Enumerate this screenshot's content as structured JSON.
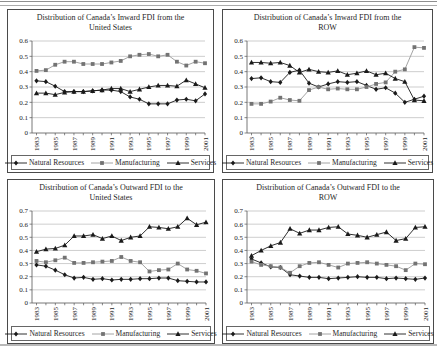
{
  "page": {
    "background": "#ffffff",
    "rule_color": "#9a9a9a"
  },
  "legend_labels": [
    "Natural Resources",
    "Manufacturing",
    "Services"
  ],
  "chart_data": [
    {
      "type": "line",
      "title_line1": "Distribution of Canada’s Inward FDI from the",
      "title_line2": "United States",
      "xlabel": "",
      "ylabel": "",
      "ylim": [
        0,
        0.6
      ],
      "ytick_step": 0.1,
      "grid": true,
      "legend_position": "bottom",
      "x": [
        1983,
        1984,
        1985,
        1986,
        1987,
        1988,
        1989,
        1990,
        1991,
        1992,
        1993,
        1994,
        1995,
        1996,
        1997,
        1998,
        1999,
        2000,
        2001
      ],
      "xtick_labels": [
        "1983",
        "1985",
        "1987",
        "1989",
        "1991",
        "1993",
        "1995",
        "1997",
        "1999",
        "2001"
      ],
      "series": [
        {
          "name": "Natural Resources",
          "marker": "diamond",
          "color": "#1a1a1a",
          "line_color": "#1a1a1a",
          "values": [
            0.34,
            0.335,
            0.305,
            0.27,
            0.27,
            0.27,
            0.275,
            0.28,
            0.28,
            0.27,
            0.235,
            0.22,
            0.19,
            0.19,
            0.19,
            0.215,
            0.22,
            0.21,
            0.255
          ]
        },
        {
          "name": "Manufacturing",
          "marker": "square",
          "color": "#737373",
          "line_color": "#9a9a9a",
          "values": [
            0.405,
            0.41,
            0.445,
            0.465,
            0.465,
            0.45,
            0.45,
            0.45,
            0.46,
            0.47,
            0.5,
            0.51,
            0.515,
            0.5,
            0.51,
            0.465,
            0.44,
            0.465,
            0.455
          ]
        },
        {
          "name": "Services",
          "marker": "triangle",
          "color": "#1a1a1a",
          "line_color": "#1a1a1a",
          "values": [
            0.26,
            0.26,
            0.25,
            0.265,
            0.27,
            0.27,
            0.275,
            0.28,
            0.29,
            0.29,
            0.27,
            0.285,
            0.3,
            0.31,
            0.31,
            0.305,
            0.345,
            0.32,
            0.295
          ]
        }
      ]
    },
    {
      "type": "line",
      "title_line1": "Distribution of Canada’s Inward FDI from the",
      "title_line2": "ROW",
      "xlabel": "",
      "ylabel": "",
      "ylim": [
        0,
        0.6
      ],
      "ytick_step": 0.1,
      "grid": true,
      "legend_position": "bottom",
      "x": [
        1983,
        1984,
        1985,
        1986,
        1987,
        1988,
        1989,
        1990,
        1991,
        1992,
        1993,
        1994,
        1995,
        1996,
        1997,
        1998,
        1999,
        2000,
        2001
      ],
      "xtick_labels": [
        "1983",
        "1985",
        "1987",
        "1989",
        "1991",
        "1993",
        "1995",
        "1997",
        "1999",
        "2001"
      ],
      "series": [
        {
          "name": "Natural Resources",
          "marker": "diamond",
          "color": "#1a1a1a",
          "line_color": "#1a1a1a",
          "values": [
            0.355,
            0.36,
            0.335,
            0.33,
            0.395,
            0.41,
            0.325,
            0.3,
            0.32,
            0.335,
            0.33,
            0.335,
            0.31,
            0.285,
            0.295,
            0.26,
            0.2,
            0.22,
            0.24
          ]
        },
        {
          "name": "Manufacturing",
          "marker": "square",
          "color": "#737373",
          "line_color": "#9a9a9a",
          "values": [
            0.19,
            0.19,
            0.205,
            0.23,
            0.215,
            0.21,
            0.28,
            0.3,
            0.285,
            0.29,
            0.285,
            0.285,
            0.3,
            0.32,
            0.33,
            0.4,
            0.415,
            0.56,
            0.555
          ]
        },
        {
          "name": "Services",
          "marker": "triangle",
          "color": "#1a1a1a",
          "line_color": "#1a1a1a",
          "values": [
            0.46,
            0.46,
            0.455,
            0.46,
            0.44,
            0.395,
            0.415,
            0.4,
            0.395,
            0.405,
            0.38,
            0.39,
            0.405,
            0.38,
            0.39,
            0.355,
            0.335,
            0.215,
            0.21
          ]
        }
      ]
    },
    {
      "type": "line",
      "title_line1": "Distribution of Canada’s Outward FDI to the",
      "title_line2": "United States",
      "xlabel": "",
      "ylabel": "",
      "ylim": [
        0,
        0.7
      ],
      "ytick_step": 0.1,
      "grid": true,
      "legend_position": "bottom",
      "x": [
        1983,
        1984,
        1985,
        1986,
        1987,
        1988,
        1989,
        1990,
        1991,
        1992,
        1993,
        1994,
        1995,
        1996,
        1997,
        1998,
        1999,
        2000,
        2001
      ],
      "xtick_labels": [
        "1983",
        "1985",
        "1987",
        "1989",
        "1991",
        "1993",
        "1995",
        "1997",
        "1999",
        "2001"
      ],
      "series": [
        {
          "name": "Natural Resources",
          "marker": "diamond",
          "color": "#1a1a1a",
          "line_color": "#1a1a1a",
          "values": [
            0.29,
            0.28,
            0.25,
            0.215,
            0.19,
            0.195,
            0.18,
            0.185,
            0.175,
            0.18,
            0.18,
            0.185,
            0.185,
            0.19,
            0.19,
            0.17,
            0.165,
            0.16,
            0.16
          ]
        },
        {
          "name": "Manufacturing",
          "marker": "square",
          "color": "#737373",
          "line_color": "#9a9a9a",
          "values": [
            0.32,
            0.31,
            0.325,
            0.345,
            0.305,
            0.305,
            0.31,
            0.315,
            0.32,
            0.35,
            0.32,
            0.31,
            0.24,
            0.25,
            0.255,
            0.3,
            0.255,
            0.245,
            0.225
          ]
        },
        {
          "name": "Services",
          "marker": "triangle",
          "color": "#1a1a1a",
          "line_color": "#1a1a1a",
          "values": [
            0.39,
            0.41,
            0.415,
            0.44,
            0.51,
            0.51,
            0.52,
            0.49,
            0.51,
            0.475,
            0.5,
            0.51,
            0.58,
            0.575,
            0.565,
            0.58,
            0.645,
            0.595,
            0.615
          ]
        }
      ]
    },
    {
      "type": "line",
      "title_line1": "Distribution of Canada’s Outward FDI to the",
      "title_line2": "ROW",
      "xlabel": "",
      "ylabel": "",
      "ylim": [
        0,
        0.7
      ],
      "ytick_step": 0.1,
      "grid": true,
      "legend_position": "bottom",
      "x": [
        1983,
        1984,
        1985,
        1986,
        1987,
        1988,
        1989,
        1990,
        1991,
        1992,
        1993,
        1994,
        1995,
        1996,
        1997,
        1998,
        1999,
        2000,
        2001
      ],
      "xtick_labels": [
        "1983",
        "1985",
        "1987",
        "1989",
        "1991",
        "1993",
        "1995",
        "1997",
        "1999",
        "2001"
      ],
      "series": [
        {
          "name": "Natural Resources",
          "marker": "diamond",
          "color": "#1a1a1a",
          "line_color": "#1a1a1a",
          "values": [
            0.335,
            0.305,
            0.275,
            0.27,
            0.215,
            0.205,
            0.195,
            0.195,
            0.185,
            0.19,
            0.195,
            0.2,
            0.195,
            0.195,
            0.185,
            0.19,
            0.185,
            0.18,
            0.19
          ]
        },
        {
          "name": "Manufacturing",
          "marker": "square",
          "color": "#737373",
          "line_color": "#9a9a9a",
          "values": [
            0.315,
            0.29,
            0.28,
            0.27,
            0.23,
            0.28,
            0.305,
            0.31,
            0.29,
            0.27,
            0.3,
            0.305,
            0.31,
            0.3,
            0.29,
            0.28,
            0.25,
            0.3,
            0.295
          ]
        },
        {
          "name": "Services",
          "marker": "triangle",
          "color": "#1a1a1a",
          "line_color": "#1a1a1a",
          "values": [
            0.36,
            0.4,
            0.435,
            0.46,
            0.565,
            0.53,
            0.555,
            0.555,
            0.575,
            0.58,
            0.525,
            0.515,
            0.5,
            0.52,
            0.54,
            0.475,
            0.49,
            0.575,
            0.58
          ]
        }
      ]
    }
  ]
}
